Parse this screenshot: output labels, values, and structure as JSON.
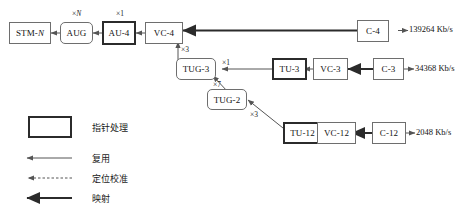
{
  "diagram": {
    "nodes": [
      {
        "id": "stm-n",
        "label": "STM-N",
        "shape": "rect",
        "border": "thin"
      },
      {
        "id": "aug",
        "label": "AUG",
        "shape": "rounded",
        "border": "thin"
      },
      {
        "id": "au-4",
        "label": "AU-4",
        "shape": "rect",
        "border": "bold"
      },
      {
        "id": "vc-4",
        "label": "VC-4",
        "shape": "rect",
        "border": "thin"
      },
      {
        "id": "c-4",
        "label": "C-4",
        "shape": "rect",
        "border": "thin"
      },
      {
        "id": "tug-3",
        "label": "TUG-3",
        "shape": "rounded",
        "border": "thin"
      },
      {
        "id": "tu-3",
        "label": "TU-3",
        "shape": "rect",
        "border": "bold"
      },
      {
        "id": "vc-3",
        "label": "VC-3",
        "shape": "rect",
        "border": "thin"
      },
      {
        "id": "c-3",
        "label": "C-3",
        "shape": "rect",
        "border": "thin"
      },
      {
        "id": "tug-2",
        "label": "TUG-2",
        "shape": "rounded",
        "border": "thin"
      },
      {
        "id": "tu-12",
        "label": "TU-12",
        "shape": "rect",
        "border": "bold"
      },
      {
        "id": "vc-12",
        "label": "VC-12",
        "shape": "rect",
        "border": "thin"
      },
      {
        "id": "c-12",
        "label": "C-12",
        "shape": "rect",
        "border": "thin"
      }
    ],
    "multipliers": [
      {
        "id": "m-aug",
        "prefix": "×",
        "value": "N",
        "italic": true
      },
      {
        "id": "m-au4",
        "prefix": "×",
        "value": "1",
        "italic": false
      },
      {
        "id": "m-tug3",
        "prefix": "×",
        "value": "3",
        "italic": false
      },
      {
        "id": "m-tu3",
        "prefix": "×",
        "value": "1",
        "italic": false
      },
      {
        "id": "m-tug2",
        "prefix": "×",
        "value": "7",
        "italic": false
      },
      {
        "id": "m-tu12",
        "prefix": "×",
        "value": "3",
        "italic": false
      }
    ],
    "rates": [
      {
        "id": "rate-c4",
        "text": "139264 Kb/s"
      },
      {
        "id": "rate-c3",
        "text": "34368 Kb/s"
      },
      {
        "id": "rate-c12",
        "text": "2048 Kb/s"
      }
    ]
  },
  "legend": {
    "items": [
      {
        "id": "legend-pointer",
        "symbol": "bold-box",
        "label": "指针处理"
      },
      {
        "id": "legend-mux",
        "symbol": "thin-arrow",
        "label": "复用"
      },
      {
        "id": "legend-align",
        "symbol": "dashed-arrow",
        "label": "定位校准"
      },
      {
        "id": "legend-map",
        "symbol": "thick-arrow",
        "label": "映射"
      }
    ]
  },
  "colors": {
    "thin_border": "#6e6e6e",
    "bold_border": "#2b2b2b",
    "line": "#555555",
    "thick_line": "#2b2b2b",
    "text": "#1a1a1a",
    "background": "#ffffff"
  }
}
